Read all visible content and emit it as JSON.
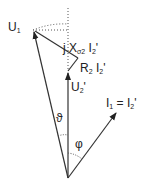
{
  "diagram": {
    "type": "transformer phasor diagram",
    "labels": {
      "u1": "U",
      "u1_sub": "1",
      "jx": "j X",
      "jx_sub": "σ2",
      "jx_tail": " I",
      "jx_tail_sub": "2",
      "jx_prime": "'",
      "r2": "R",
      "r2_sub": "2",
      "r2_tail": " I",
      "r2_tail_sub": "2",
      "r2_prime": "'",
      "u2": "U",
      "u2_sub": "2",
      "u2_prime": "'",
      "i1": "I",
      "i1_sub": "1",
      "i1_eq": " = I",
      "i1_eq_sub": "2",
      "i1_prime": "'",
      "theta": "ϑ",
      "phi": "φ"
    },
    "colors": {
      "line": "#333333",
      "dotted": "#555555"
    }
  }
}
